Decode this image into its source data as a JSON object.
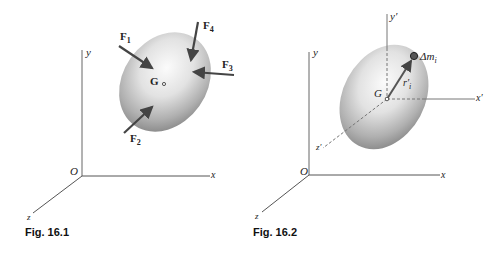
{
  "figures": [
    {
      "id": "fig-16-1",
      "caption": "Fig. 16.1",
      "axes": {
        "origin": "O",
        "x": "x",
        "y": "y",
        "z": "z"
      },
      "center_of_mass": "G",
      "forces": [
        {
          "name": "F",
          "sub": "1"
        },
        {
          "name": "F",
          "sub": "2"
        },
        {
          "name": "F",
          "sub": "3"
        },
        {
          "name": "F",
          "sub": "4"
        }
      ]
    },
    {
      "id": "fig-16-2",
      "caption": "Fig. 16.2",
      "axes": {
        "origin": "O",
        "x": "x",
        "y": "y",
        "z": "z"
      },
      "centroidal_axes": {
        "x": "x′",
        "y": "y′",
        "z": "z′"
      },
      "center_of_mass": "G",
      "position_vector": {
        "name": "r′",
        "sub": "i"
      },
      "mass_element": {
        "name": "Δm",
        "sub": "i"
      }
    }
  ],
  "colors": {
    "axis": "#555555",
    "arrow": "#4a4a4a",
    "body_light": "#f4f4f4",
    "body_dark": "#8a8a8a",
    "particle": "#333333"
  }
}
